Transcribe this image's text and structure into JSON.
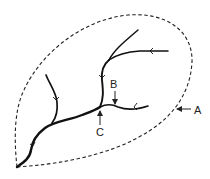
{
  "diagram": {
    "type": "drainage-basin",
    "labels": {
      "A": "A",
      "B": "B",
      "C": "C"
    },
    "colors": {
      "stream": "#111111",
      "boundary": "#222222",
      "label": "#222222",
      "background": "#ffffff"
    },
    "elements": [
      {
        "id": "A",
        "points_to": "watershed boundary (dashed line)"
      },
      {
        "id": "B",
        "points_to": "tributary stream"
      },
      {
        "id": "C",
        "points_to": "confluence of streams"
      }
    ]
  }
}
